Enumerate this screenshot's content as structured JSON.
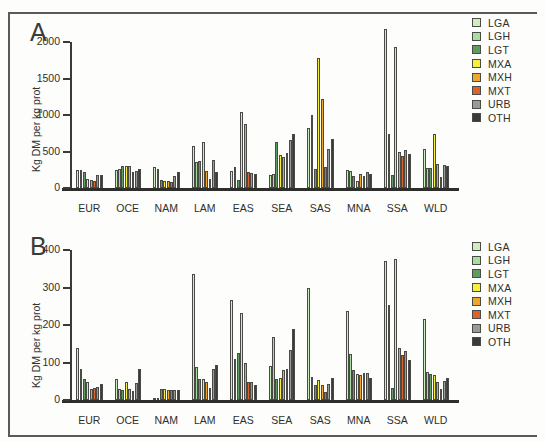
{
  "figure": {
    "panels": [
      "A",
      "B"
    ]
  },
  "legend": {
    "position": "right",
    "entries": [
      {
        "label": "LGA",
        "color": "#cdeec0"
      },
      {
        "label": "LGH",
        "color": "#a7dda0"
      },
      {
        "label": "LGT",
        "color": "#5f9c62"
      },
      {
        "label": "MXA",
        "color": "#f7f03a"
      },
      {
        "label": "MXH",
        "color": "#f0a62a"
      },
      {
        "label": "MXT",
        "color": "#d9642c"
      },
      {
        "label": "URB",
        "color": "#9a9a98"
      },
      {
        "label": "OTH",
        "color": "#3a3a38"
      }
    ]
  },
  "chart_data": [
    {
      "type": "bar",
      "panel": "A",
      "title": "A",
      "xlabel": "",
      "ylabel": "Kg DM per kg prot",
      "ylim": [
        0,
        2000
      ],
      "yticks": [
        0,
        500,
        1000,
        1500,
        2000
      ],
      "grid": false,
      "categories": [
        "EUR",
        "OCE",
        "NAM",
        "LAM",
        "EAS",
        "SEA",
        "SAS",
        "MNA",
        "SSA",
        "WLD"
      ],
      "series": [
        {
          "name": "LGA",
          "color": "#cdeec0",
          "values": [
            245,
            240,
            290,
            580,
            230,
            180,
            820,
            250,
            2175,
            540
          ]
        },
        {
          "name": "LGH",
          "color": "#a7dda0",
          "values": [
            250,
            255,
            260,
            350,
            285,
            195,
            1005,
            230,
            740,
            275
          ]
        },
        {
          "name": "LGT",
          "color": "#5f9c62",
          "values": [
            215,
            300,
            115,
            370,
            110,
            625,
            265,
            165,
            175,
            275
          ]
        },
        {
          "name": "MXA",
          "color": "#f7f03a",
          "values": [
            130,
            300,
            90,
            625,
            1045,
            450,
            1775,
            95,
            1925,
            740
          ]
        },
        {
          "name": "MXH",
          "color": "#f0a62a",
          "values": [
            105,
            295,
            95,
            230,
            880,
            420,
            1225,
            190,
            500,
            330
          ]
        },
        {
          "name": "MXT",
          "color": "#d9642c",
          "values": [
            100,
            215,
            85,
            130,
            215,
            480,
            285,
            165,
            440,
            150
          ]
        },
        {
          "name": "URB",
          "color": "#9a9a98",
          "values": [
            180,
            235,
            170,
            390,
            200,
            655,
            530,
            215,
            520,
            320
          ]
        },
        {
          "name": "OTH",
          "color": "#3a3a38",
          "values": [
            175,
            265,
            215,
            215,
            195,
            745,
            665,
            190,
            460,
            300
          ]
        }
      ]
    },
    {
      "type": "bar",
      "panel": "B",
      "title": "B",
      "xlabel": "",
      "ylabel": "Kg DM per kg prot",
      "ylim": [
        0,
        400
      ],
      "yticks": [
        0,
        100,
        200,
        300,
        400
      ],
      "grid": false,
      "categories": [
        "EUR",
        "OCE",
        "NAM",
        "LAM",
        "EAS",
        "SEA",
        "SAS",
        "MNA",
        "SSA",
        "WLD"
      ],
      "series": [
        {
          "name": "LGA",
          "color": "#cdeec0",
          "values": [
            138,
            56,
            5,
            336,
            268,
            92,
            298,
            237,
            370,
            216
          ]
        },
        {
          "name": "LGH",
          "color": "#a7dda0",
          "values": [
            84,
            30,
            5,
            88,
            110,
            168,
            62,
            122,
            253,
            75
          ]
        },
        {
          "name": "LGT",
          "color": "#5f9c62",
          "values": [
            55,
            28,
            30,
            56,
            126,
            56,
            40,
            80,
            32,
            70
          ]
        },
        {
          "name": "MXA",
          "color": "#f7f03a",
          "values": [
            48,
            49,
            30,
            55,
            232,
            58,
            53,
            70,
            375,
            68
          ]
        },
        {
          "name": "MXH",
          "color": "#f0a62a",
          "values": [
            30,
            29,
            28,
            48,
            100,
            80,
            40,
            68,
            138,
            48
          ]
        },
        {
          "name": "MXT",
          "color": "#d9642c",
          "values": [
            32,
            24,
            26,
            32,
            48,
            82,
            22,
            72,
            120,
            30
          ]
        },
        {
          "name": "URB",
          "color": "#9a9a98",
          "values": [
            36,
            46,
            26,
            84,
            48,
            133,
            44,
            72,
            130,
            52
          ]
        },
        {
          "name": "OTH",
          "color": "#3a3a38",
          "values": [
            42,
            84,
            26,
            94,
            40,
            190,
            60,
            58,
            108,
            58
          ]
        }
      ]
    }
  ]
}
